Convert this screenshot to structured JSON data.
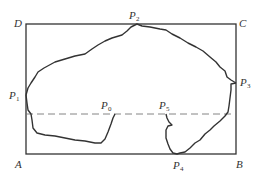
{
  "diagram": {
    "type": "geometry-figure",
    "colors": {
      "stroke": "#333333",
      "dashed": "#777777",
      "background": "#ffffff"
    },
    "corners": {
      "A": {
        "letter": "A"
      },
      "B": {
        "letter": "B"
      },
      "C": {
        "letter": "C"
      },
      "D": {
        "letter": "D"
      }
    },
    "points": {
      "P0": {
        "letter": "P",
        "sub": "0"
      },
      "P1": {
        "letter": "P",
        "sub": "1"
      },
      "P2": {
        "letter": "P",
        "sub": "2"
      },
      "P3": {
        "letter": "P",
        "sub": "3"
      },
      "P4": {
        "letter": "P",
        "sub": "4"
      },
      "P5": {
        "letter": "P",
        "sub": "5"
      }
    }
  }
}
